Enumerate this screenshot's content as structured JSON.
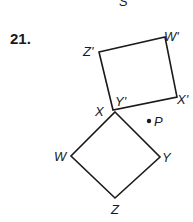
{
  "problem": {
    "number": "21.",
    "partial_top_label": "S"
  },
  "figures": {
    "preimage": {
      "name": "WXYZ",
      "vertices": [
        {
          "label": "X",
          "x": 115,
          "y": 112
        },
        {
          "label": "Y",
          "x": 160,
          "y": 157
        },
        {
          "label": "Z",
          "x": 115,
          "y": 198
        },
        {
          "label": "W",
          "x": 71,
          "y": 156
        }
      ]
    },
    "image": {
      "name": "W'X'Y'Z'",
      "vertices": [
        {
          "label": "Z'",
          "x": 99,
          "y": 52
        },
        {
          "label": "W'",
          "x": 165,
          "y": 37
        },
        {
          "label": "X'",
          "x": 177,
          "y": 97
        },
        {
          "label": "Y'",
          "x": 113,
          "y": 110
        }
      ]
    },
    "point": {
      "label": "P",
      "x": 149,
      "y": 121
    }
  },
  "labels": {
    "X": "X",
    "Y": "Y",
    "Z": "Z",
    "W": "W",
    "Xp": "X'",
    "Yp": "Y'",
    "Zp": "Z'",
    "Wp": "W'",
    "P": "P"
  },
  "colors": {
    "ink": "#1a1a1a",
    "background": "#ffffff"
  }
}
